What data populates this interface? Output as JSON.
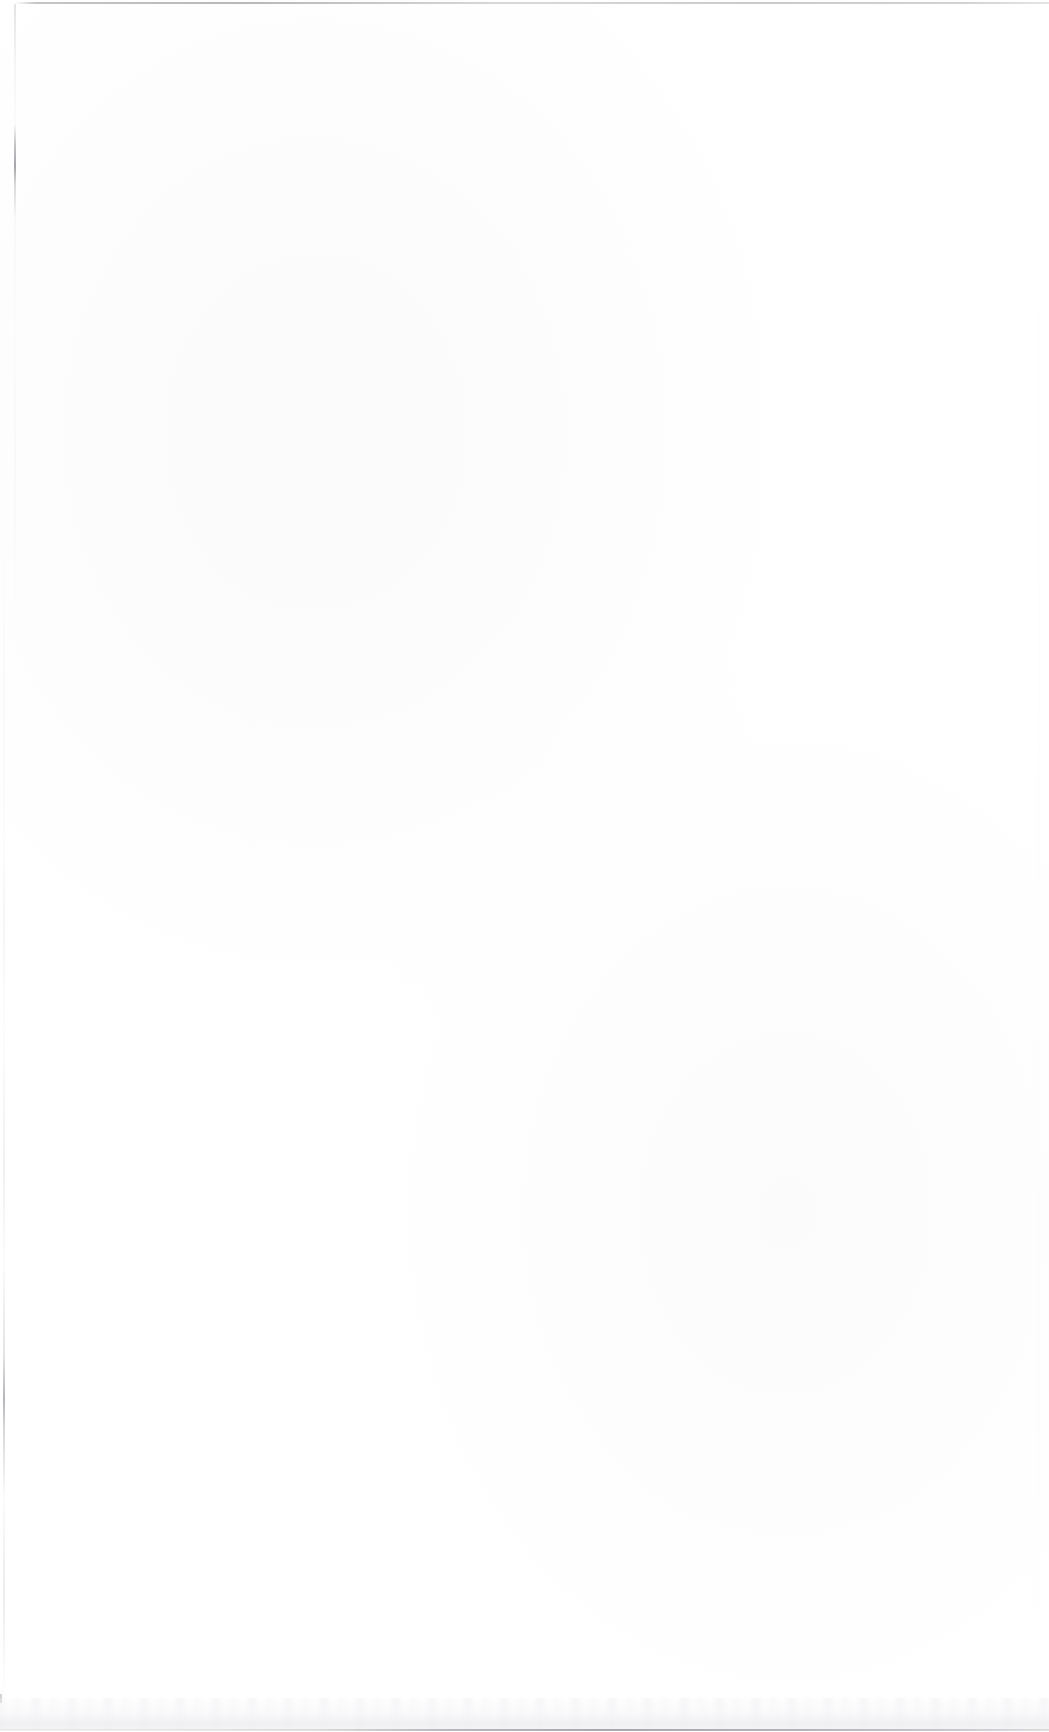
{
  "document": {
    "page_type": "blank-scanned-page",
    "orientation": "portrait",
    "background_color": "#ffffff",
    "body_text": "",
    "header_text": "",
    "footer_text": "",
    "page_number": ""
  },
  "artifacts": {
    "top_rule": {
      "name": "top-edge-rule",
      "color": "#8e8e91",
      "label": ""
    },
    "left_gutter": {
      "name": "left-gutter-shadow",
      "color": "#b4b4b9",
      "label": ""
    },
    "right_edge": {
      "name": "right-edge-line",
      "color": "#ededf0",
      "label": ""
    },
    "bottom_band": {
      "name": "bottom-scan-band",
      "color": "#eeeef1",
      "label": ""
    },
    "bottom_rule": {
      "name": "bottom-edge-rule",
      "color": "#828288",
      "label": ""
    }
  }
}
